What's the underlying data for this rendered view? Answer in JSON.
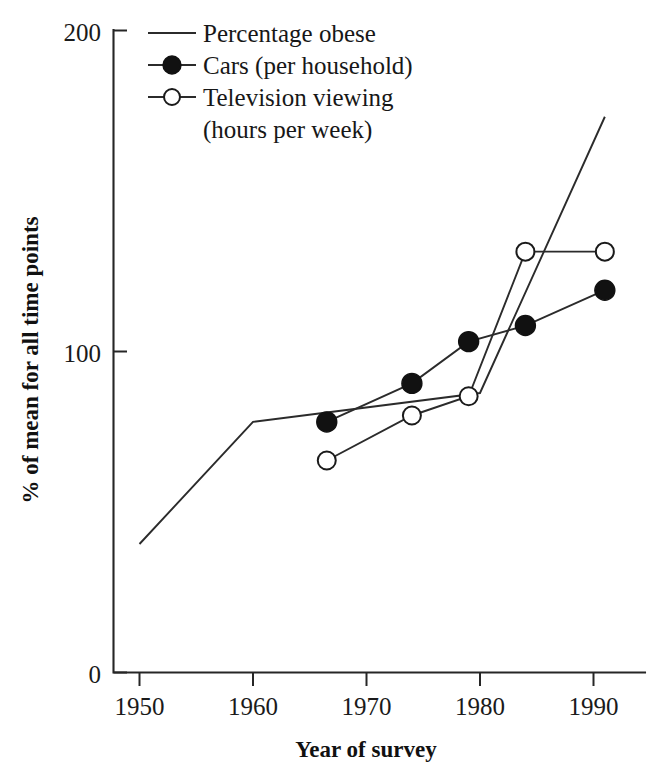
{
  "chart_data": {
    "type": "line",
    "title": "",
    "xlabel": "Year of survey",
    "ylabel": "% of mean for all time points",
    "xlim": [
      1948,
      1993
    ],
    "ylim": [
      0,
      200
    ],
    "grid": false,
    "legend_position": "top-left-inside",
    "x_ticks": [
      1950,
      1960,
      1970,
      1980,
      1990
    ],
    "x_tick_labels": [
      "1950",
      "1960",
      "1970",
      "1980",
      "1990"
    ],
    "y_ticks": [
      0,
      100,
      200
    ],
    "y_tick_labels": [
      "0",
      "100",
      "200"
    ],
    "series": [
      {
        "name": "Percentage obese",
        "marker": "none",
        "x": [
          1950,
          1960,
          1980,
          1991
        ],
        "values": [
          40,
          78,
          87,
          173
        ]
      },
      {
        "name": "Cars (per household)",
        "marker": "filled-circle",
        "x": [
          1966.5,
          1974,
          1979,
          1984,
          1991
        ],
        "values": [
          78,
          90,
          103,
          108,
          119
        ]
      },
      {
        "name": "Television viewing (hours per week)",
        "marker": "open-circle",
        "x": [
          1966.5,
          1974,
          1979,
          1984,
          1991
        ],
        "values": [
          66,
          80,
          86,
          131,
          131
        ]
      }
    ]
  },
  "legend": {
    "entries": [
      {
        "label": "Percentage obese",
        "marker": "none"
      },
      {
        "label": "Cars (per household)",
        "marker": "filled-circle"
      },
      {
        "label": "Television viewing",
        "marker": "open-circle"
      },
      {
        "label": "(hours per week)",
        "marker": "none-continuation"
      }
    ]
  },
  "axes": {
    "y_label": "% of mean for all time points",
    "x_label": "Year of survey",
    "y_tick_top": "200",
    "y_tick_mid": "100",
    "y_tick_bottom": "0",
    "x_tick_1": "1950",
    "x_tick_2": "1960",
    "x_tick_3": "1970",
    "x_tick_4": "1980",
    "x_tick_5": "1990"
  },
  "style": {
    "ink": "#1a1a1a",
    "background": "#ffffff"
  }
}
